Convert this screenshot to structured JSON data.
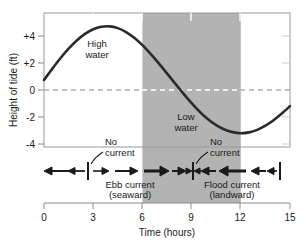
{
  "chart_data": {
    "type": "line",
    "title": "",
    "xlabel": "Time (hours)",
    "ylabel": "Height of tide (ft)",
    "xlim": [
      0,
      15
    ],
    "ylim": [
      -5,
      5
    ],
    "xticks": [
      "0",
      "3",
      "6",
      "9",
      "12",
      "15"
    ],
    "xtick_values": [
      0,
      3,
      6,
      9,
      12,
      15
    ],
    "yticks": [
      "+4",
      "+2",
      "0",
      "-2",
      "-4"
    ],
    "ytick_values": [
      4,
      2,
      0,
      -2,
      -4
    ],
    "grid": false,
    "legend": "none",
    "series": [
      {
        "name": "Height of tide",
        "x": [
          0,
          0.5,
          1,
          1.5,
          2,
          2.5,
          3,
          3.5,
          4,
          4.5,
          5,
          5.5,
          6,
          6.5,
          7,
          7.5,
          8,
          8.5,
          9,
          9.5,
          10,
          10.5,
          11,
          11.5,
          12,
          12.5,
          13,
          13.5,
          14,
          14.5,
          15
        ],
        "values": [
          0,
          0.83,
          1.62,
          2.34,
          2.95,
          3.44,
          3.79,
          3.97,
          4.0,
          3.87,
          3.58,
          3.15,
          2.6,
          1.95,
          1.24,
          0.49,
          -0.27,
          -1.02,
          -1.73,
          -2.38,
          -2.93,
          -3.37,
          -3.69,
          -3.89,
          -3.97,
          -3.91,
          -3.72,
          -3.41,
          -3.0,
          -2.5,
          -1.95
        ]
      }
    ],
    "zero_line": {
      "value": 0,
      "style": "dashed"
    },
    "shaded_region": {
      "x_start": 6,
      "x_end": 12,
      "color": "#b3b3b3"
    },
    "curve_color": "#2b2b2b",
    "annotations": [
      {
        "id": "high-water",
        "text_line1": "High",
        "text_line2": "water",
        "x": 3.0,
        "y": 3.0
      },
      {
        "id": "low-water",
        "text_line1": "Low",
        "text_line2": "water",
        "x": 9.0,
        "y": -2.1
      },
      {
        "id": "no-current-left",
        "text_line1": "No",
        "text_line2": "current",
        "x": 3.5,
        "y": -5.6
      },
      {
        "id": "no-current-right",
        "text_line1": "No",
        "text_line2": "current",
        "x": 10.1,
        "y": -5.6
      }
    ],
    "current_bands": [
      {
        "id": "ebb-current",
        "label_line1": "Ebb current",
        "label_line2": "(seaward)",
        "direction": "right",
        "x_start": 2.7,
        "x_end": 9.1
      },
      {
        "id": "flood-current",
        "label_line1": "Flood current",
        "label_line2": "(landward)",
        "direction": "left",
        "x_start": 9.1,
        "x_end": 14.4
      }
    ],
    "slack_markers": [
      {
        "id": "slack-left",
        "x": 2.7
      },
      {
        "id": "slack-right",
        "x": 9.1
      },
      {
        "id": "slack-end",
        "x": 14.4
      }
    ]
  },
  "colors": {
    "shade": "#b3b3b3",
    "curve": "#2b2b2b",
    "frame": "#999999",
    "zero_line_outside": "#b0b0b0",
    "zero_line_inside": "#ffffff",
    "text": "#1a1a1a",
    "arrow": "#1a1a1a"
  }
}
